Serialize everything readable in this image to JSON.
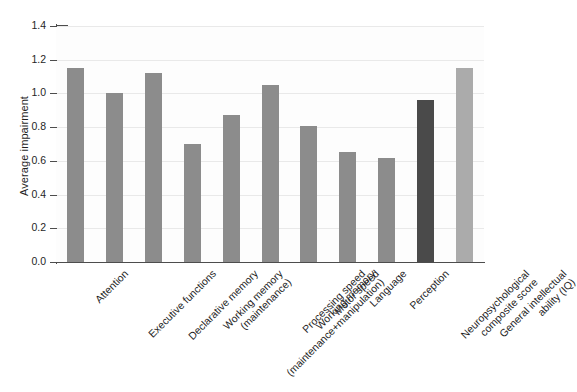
{
  "chart_data": {
    "type": "bar",
    "title": "",
    "xlabel": "",
    "ylabel": "Average impairment",
    "ylim": [
      0.0,
      1.4
    ],
    "ytick_labels": [
      "0.0",
      "0.2",
      "0.4",
      "0.6",
      "0.8",
      "1.0",
      "1.2",
      "1.4"
    ],
    "ytick_values": [
      0.0,
      0.2,
      0.4,
      0.6,
      0.8,
      1.0,
      1.2,
      1.4
    ],
    "grid": "horizontal",
    "legend": "none",
    "categories": [
      "Attention",
      "Executive functions",
      "Declarative memory",
      "Working memory (maintenance)",
      "Working memory (maintenance+manipulation)",
      "Processing speed",
      "Motor speed",
      "Language",
      "Perception",
      "Neuropsychological composite score",
      "General intellectual ability (IQ)"
    ],
    "values": [
      1.15,
      1.0,
      1.12,
      0.7,
      0.87,
      1.05,
      0.81,
      0.655,
      0.62,
      0.96,
      1.15
    ],
    "bar_colors": [
      "#8c8c8c",
      "#8c8c8c",
      "#8c8c8c",
      "#8c8c8c",
      "#8c8c8c",
      "#8c8c8c",
      "#8c8c8c",
      "#8c8c8c",
      "#8c8c8c",
      "#4a4a4a",
      "#ababab"
    ],
    "category_label_lines": [
      [
        "Attention"
      ],
      [
        "Executive functions"
      ],
      [
        "Declarative memory"
      ],
      [
        "Working memory",
        "(maintenance)"
      ],
      [
        "Working memory",
        "(maintenance+manipulation)"
      ],
      [
        "Processing speed"
      ],
      [
        "Motor speed"
      ],
      [
        "Language"
      ],
      [
        "Perception"
      ],
      [
        "Neuropsychological",
        "composite score"
      ],
      [
        "General intellectual",
        "ability (IQ)"
      ]
    ]
  },
  "colors": {
    "background": "#ffffff",
    "plot_background": "#fdfdfd",
    "axis": "#4d4d4d",
    "grid": "#e9e9e9",
    "bar_default": "#8c8c8c",
    "bar_highlight_dark": "#4a4a4a",
    "bar_highlight_light": "#ababab",
    "text": "#1f1f1f"
  }
}
